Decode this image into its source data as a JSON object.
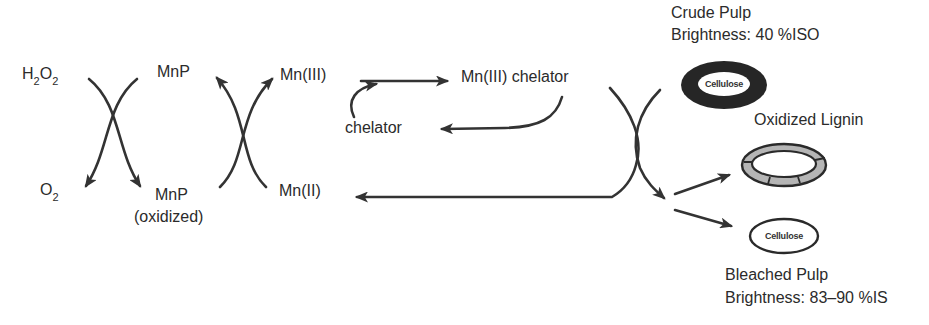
{
  "diagram": {
    "type": "reaction-cycle",
    "colors": {
      "line": "#333333",
      "text": "#2b2b2b",
      "lignin_dark": "#2a2a2a",
      "lignin_gray": "#b8b8b8",
      "background": "#ffffff"
    },
    "reactants": {
      "h2o2": {
        "base": "H",
        "sub1": "2",
        "mid": "O",
        "sub2": "2"
      },
      "o2": {
        "base": "O",
        "sub": "2"
      }
    },
    "enzyme": {
      "mnp": "MnP",
      "mnp_oxidized_line1": "MnP",
      "mnp_oxidized_line2": "(oxidized)"
    },
    "manganese": {
      "mn3": "Mn(III)",
      "mn2": "Mn(II)"
    },
    "chelation": {
      "mn3_chelator": "Mn(III) chelator",
      "chelator": "chelator"
    },
    "pulp": {
      "crude_title": "Crude Pulp",
      "crude_brightness": "Brightness: 40 %ISO",
      "crude_core_label": "Cellulose",
      "oxidized_lignin": "Oxidized Lignin",
      "bleached_core_label": "Cellulose",
      "bleached_title": "Bleached Pulp",
      "bleached_brightness": "Brightness: 83–90 %IS"
    },
    "nodes": [
      {
        "id": "H2O2",
        "label": "H2O2"
      },
      {
        "id": "O2",
        "label": "O2"
      },
      {
        "id": "MnP",
        "label": "MnP"
      },
      {
        "id": "MnP_ox",
        "label": "MnP (oxidized)"
      },
      {
        "id": "Mn3",
        "label": "Mn(III)"
      },
      {
        "id": "Mn2",
        "label": "Mn(II)"
      },
      {
        "id": "Mn3_chel",
        "label": "Mn(III) chelator"
      },
      {
        "id": "chelator",
        "label": "chelator"
      },
      {
        "id": "crude",
        "label": "Crude Pulp (Brightness: 40 %ISO)"
      },
      {
        "id": "lignin_ox",
        "label": "Oxidized Lignin"
      },
      {
        "id": "bleached",
        "label": "Bleached Pulp (Brightness: 83–90 %ISO)"
      }
    ],
    "edges": [
      {
        "from": "H2O2",
        "to": "O2",
        "style": "crossing-curve"
      },
      {
        "from": "MnP",
        "to": "MnP_ox",
        "style": "crossing-curve"
      },
      {
        "from": "MnP_ox",
        "to": "MnP",
        "style": "crossing-curve"
      },
      {
        "from": "Mn2",
        "to": "Mn3",
        "style": "crossing-curve"
      },
      {
        "from": "Mn3",
        "to": "Mn3_chel",
        "style": "straight"
      },
      {
        "from": "chelator",
        "to": "Mn3_chel",
        "style": "curved-join"
      },
      {
        "from": "Mn3_chel",
        "to": "chelator",
        "style": "curved-return"
      },
      {
        "from": "Mn3_chel",
        "to": "crude",
        "style": "crossing-curve"
      },
      {
        "from": "crude",
        "to": "Mn2",
        "style": "elbow-return"
      },
      {
        "from": "crude",
        "to": "lignin_ox",
        "style": "straight"
      },
      {
        "from": "crude",
        "to": "bleached",
        "style": "straight"
      }
    ]
  }
}
